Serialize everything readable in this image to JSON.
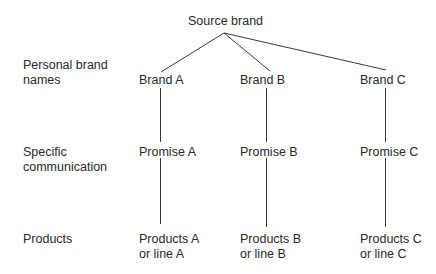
{
  "diagram": {
    "root": {
      "label": "Source brand"
    },
    "row_labels": {
      "brand_names": [
        "Personal brand",
        "names"
      ],
      "communication": [
        "Specific",
        "communication"
      ],
      "products": [
        "Products"
      ]
    },
    "branches": [
      {
        "brand": "Brand A",
        "promise": "Promise A",
        "products": [
          "Products A",
          "or line A"
        ]
      },
      {
        "brand": "Brand B",
        "promise": "Promise B",
        "products": [
          "Products B",
          "or line B"
        ]
      },
      {
        "brand": "Brand C",
        "promise": "Promise C",
        "products": [
          "Products C",
          "or line C"
        ]
      }
    ]
  }
}
